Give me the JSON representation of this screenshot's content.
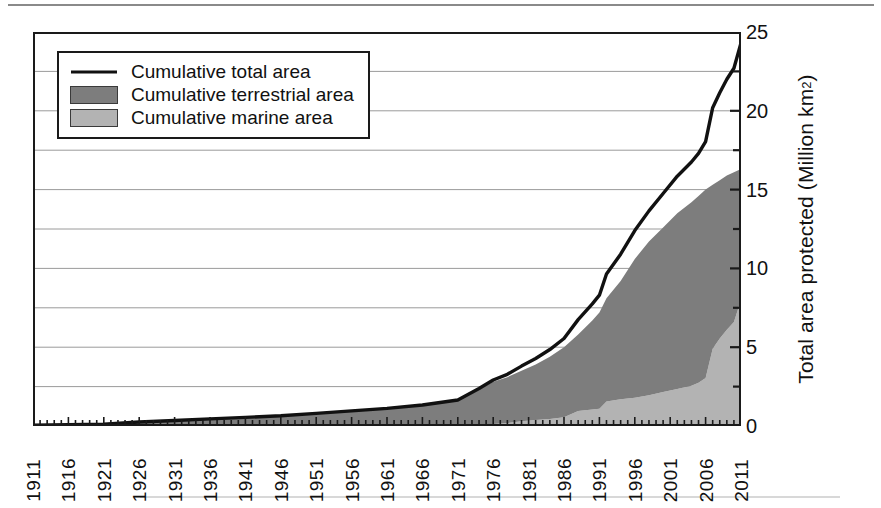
{
  "chart_data": {
    "type": "area",
    "title": "",
    "xlabel": "",
    "ylabel": "Total area protected (Million km2)",
    "ylabel_html": "Total area protected (Million km<sup>2</sup>)",
    "xlim": [
      1911,
      2011
    ],
    "ylim": [
      0,
      25
    ],
    "y_major_ticks": [
      0,
      5,
      10,
      15,
      20,
      25
    ],
    "y_minor_ticks": [
      2.5,
      7.5,
      12.5,
      17.5,
      22.5
    ],
    "y_tick_labels": [
      "0",
      "5",
      "10",
      "15",
      "20",
      "25"
    ],
    "grid": "horizontal",
    "gridline_values": [
      2.5,
      5,
      7.5,
      10,
      12.5,
      15,
      17.5,
      20,
      22.5
    ],
    "x_tick_labels": [
      "1911",
      "1916",
      "1921",
      "1926",
      "1931",
      "1936",
      "1941",
      "1946",
      "1951",
      "1956",
      "1961",
      "1966",
      "1971",
      "1976",
      "1981",
      "1986",
      "1991",
      "1996",
      "2001",
      "2006",
      "2011"
    ],
    "x_minor_tick_interval": 1,
    "legend_position": "upper-left",
    "colors": {
      "total_line": "#111111",
      "terrestrial_fill": "#7d7d7d",
      "marine_fill": "#b3b3b3",
      "axis": "#1a1a1a",
      "grid": "#8e8e8e"
    },
    "legend": [
      {
        "label": "Cumulative total area",
        "key": "line",
        "color": "#111111"
      },
      {
        "label": "Cumulative terrestrial area",
        "key": "swatch",
        "color": "#7d7d7d"
      },
      {
        "label": "Cumulative marine area",
        "key": "swatch",
        "color": "#b3b3b3"
      }
    ],
    "series": [
      {
        "name": "Cumulative marine area",
        "stack_order": 1,
        "x": [
          1911,
          1916,
          1921,
          1926,
          1931,
          1936,
          1941,
          1946,
          1951,
          1956,
          1961,
          1966,
          1971,
          1974,
          1976,
          1978,
          1980,
          1982,
          1984,
          1986,
          1988,
          1990,
          1991,
          1992,
          1994,
          1996,
          1998,
          2000,
          2002,
          2004,
          2005,
          2006,
          2007,
          2008,
          2009,
          2010,
          2011
        ],
        "values": [
          0,
          0,
          0,
          0,
          0,
          0,
          0,
          0,
          0,
          0.01,
          0.02,
          0.03,
          0.05,
          0.08,
          0.12,
          0.18,
          0.3,
          0.38,
          0.45,
          0.55,
          0.95,
          1.05,
          1.1,
          1.55,
          1.7,
          1.8,
          1.95,
          2.15,
          2.35,
          2.55,
          2.75,
          3.05,
          4.9,
          5.55,
          6.1,
          6.6,
          8.0
        ]
      },
      {
        "name": "Cumulative terrestrial area",
        "stack_order": 2,
        "x": [
          1911,
          1916,
          1921,
          1926,
          1931,
          1936,
          1941,
          1946,
          1951,
          1956,
          1961,
          1966,
          1971,
          1974,
          1976,
          1978,
          1980,
          1982,
          1984,
          1986,
          1988,
          1990,
          1991,
          1992,
          1994,
          1996,
          1998,
          2000,
          2002,
          2004,
          2005,
          2006,
          2007,
          2008,
          2009,
          2010,
          2011
        ],
        "values": [
          0.05,
          0.08,
          0.12,
          0.25,
          0.35,
          0.45,
          0.55,
          0.65,
          0.8,
          0.95,
          1.1,
          1.3,
          1.6,
          2.3,
          2.8,
          3.1,
          3.5,
          3.9,
          4.4,
          5.0,
          5.8,
          6.7,
          7.2,
          8.1,
          9.2,
          10.6,
          11.7,
          12.6,
          13.5,
          14.2,
          14.6,
          15.0,
          15.3,
          15.6,
          15.9,
          16.1,
          16.3
        ]
      },
      {
        "name": "Cumulative total area",
        "stack_order": 3,
        "x": [
          1911,
          1916,
          1921,
          1926,
          1931,
          1936,
          1941,
          1946,
          1951,
          1956,
          1961,
          1966,
          1971,
          1974,
          1976,
          1978,
          1980,
          1982,
          1984,
          1986,
          1988,
          1990,
          1991,
          1992,
          1994,
          1996,
          1998,
          2000,
          2002,
          2004,
          2005,
          2006,
          2007,
          2008,
          2009,
          2010,
          2011
        ],
        "values": [
          0.05,
          0.08,
          0.12,
          0.25,
          0.35,
          0.45,
          0.55,
          0.65,
          0.8,
          0.96,
          1.12,
          1.33,
          1.65,
          2.38,
          2.92,
          3.28,
          3.8,
          4.28,
          4.85,
          5.55,
          6.75,
          7.75,
          8.3,
          9.65,
          10.9,
          12.4,
          13.65,
          14.75,
          15.85,
          16.75,
          17.3,
          18.05,
          20.2,
          21.15,
          22.0,
          22.7,
          24.3
        ]
      }
    ]
  }
}
